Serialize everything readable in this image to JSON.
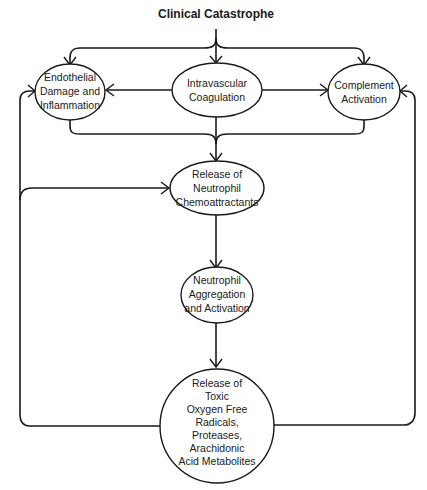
{
  "diagram": {
    "title": "Clinical Catastrophe",
    "colors": {
      "stroke": "#1a1a1a",
      "background": "#ffffff"
    },
    "nodes": {
      "endothelial": {
        "lines": [
          "Endothelial",
          "Damage and",
          "Inflammation"
        ],
        "shape": "ellipse"
      },
      "coagulation": {
        "lines": [
          "Intravascular",
          "Coagulation"
        ],
        "shape": "ellipse"
      },
      "complement": {
        "lines": [
          "Complement",
          "Activation"
        ],
        "shape": "ellipse"
      },
      "chemoattractants": {
        "lines": [
          "Release of",
          "Neutrophil",
          "Chemoattractants"
        ],
        "shape": "ellipse"
      },
      "aggregation": {
        "lines": [
          "Neutrophil",
          "Aggregation",
          "and Activation"
        ],
        "shape": "ellipse"
      },
      "toxic": {
        "lines": [
          "Release of",
          "Toxic",
          "Oxygen Free",
          "Radicals,",
          "Proteases,",
          "Arachidonic",
          "Acid Metabolites"
        ],
        "shape": "circle"
      }
    },
    "edges": [
      {
        "from": "Clinical Catastrophe",
        "to": "endothelial"
      },
      {
        "from": "Clinical Catastrophe",
        "to": "coagulation"
      },
      {
        "from": "Clinical Catastrophe",
        "to": "complement"
      },
      {
        "from": "coagulation",
        "to": "endothelial"
      },
      {
        "from": "coagulation",
        "to": "complement"
      },
      {
        "from": "endothelial",
        "to": "chemoattractants"
      },
      {
        "from": "coagulation",
        "to": "chemoattractants"
      },
      {
        "from": "complement",
        "to": "chemoattractants"
      },
      {
        "from": "chemoattractants",
        "to": "aggregation"
      },
      {
        "from": "aggregation",
        "to": "toxic"
      },
      {
        "from": "toxic",
        "to": "endothelial"
      },
      {
        "from": "toxic",
        "to": "chemoattractants"
      },
      {
        "from": "toxic",
        "to": "complement"
      }
    ]
  }
}
